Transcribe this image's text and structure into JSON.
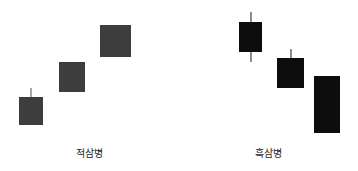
{
  "figure": {
    "width": 358,
    "height": 171,
    "background": "#ffffff"
  },
  "chart_data": {
    "type": "candlestick",
    "title": "",
    "xlabel": "",
    "ylabel": "",
    "grid": false,
    "legend": "none",
    "axis_visible": false,
    "note": "Two Korean candlestick chart patterns shown side by side with captions",
    "groups": [
      {
        "id": "three-white-soldiers",
        "label": "적삼병",
        "body_color": "#3d3d3d",
        "wick_color": "#555555",
        "direction": "ascending",
        "candles": [
          {
            "index": 1,
            "x": 19,
            "width": 24,
            "body_top": 97,
            "body_bottom": 125,
            "wick_top": 88,
            "wick_bottom": 97,
            "has_upper_wick": true,
            "has_lower_wick": false
          },
          {
            "index": 2,
            "x": 59,
            "width": 26,
            "body_top": 62,
            "body_bottom": 92,
            "wick_top": 62,
            "wick_bottom": 92,
            "has_upper_wick": false,
            "has_lower_wick": false
          },
          {
            "index": 3,
            "x": 100,
            "width": 31,
            "body_top": 25,
            "body_bottom": 57,
            "wick_top": 25,
            "wick_bottom": 57,
            "has_upper_wick": false,
            "has_lower_wick": false
          }
        ]
      },
      {
        "id": "three-black-crows",
        "label": "흑삼병",
        "body_color": "#0d0d0d",
        "wick_color": "#1a1a1a",
        "direction": "descending",
        "candles": [
          {
            "index": 1,
            "x": 239,
            "width": 23,
            "body_top": 22,
            "body_bottom": 52,
            "wick_top": 12,
            "wick_bottom": 62,
            "has_upper_wick": true,
            "has_lower_wick": true
          },
          {
            "index": 2,
            "x": 277,
            "width": 27,
            "body_top": 58,
            "body_bottom": 88,
            "wick_top": 49,
            "wick_bottom": 58,
            "has_upper_wick": true,
            "has_lower_wick": false
          },
          {
            "index": 3,
            "x": 314,
            "width": 26,
            "body_top": 76,
            "body_bottom": 133,
            "wick_top": 76,
            "wick_bottom": 133,
            "has_upper_wick": false,
            "has_lower_wick": false
          }
        ]
      }
    ],
    "labels": [
      {
        "text": "적삼병",
        "x": 0,
        "y": 147,
        "width": 179
      },
      {
        "text": "흑삼병",
        "x": 179,
        "y": 147,
        "width": 179
      }
    ]
  }
}
